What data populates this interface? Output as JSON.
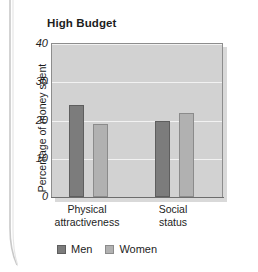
{
  "chart_data": {
    "type": "bar",
    "title": "High Budget",
    "xlabel": "",
    "ylabel": "Percentage of money spent",
    "ylim": [
      0,
      40
    ],
    "yticks": [
      0,
      10,
      20,
      30,
      40
    ],
    "ytick_labels": [
      "0",
      "10",
      "20",
      "30",
      "40"
    ],
    "grid": true,
    "legend_position": "bottom-left",
    "categories": [
      "Physical attractiveness",
      "Social status"
    ],
    "category_lines": [
      [
        "Physical",
        "attractiveness"
      ],
      [
        "Social",
        "status"
      ]
    ],
    "series": [
      {
        "name": "Men",
        "color": "#7c7c7c",
        "values": [
          24,
          20
        ]
      },
      {
        "name": "Women",
        "color": "#b1b1b1",
        "values": [
          19,
          22
        ]
      }
    ]
  },
  "legend": {
    "items": [
      {
        "label": "Men"
      },
      {
        "label": "Women"
      }
    ]
  },
  "colors": {
    "plot_background": "#d2d2d2",
    "gridline": "#f2f2f2",
    "men_bar": "#7c7c7c",
    "women_bar": "#b1b1b1",
    "text": "#1d1d1d"
  }
}
